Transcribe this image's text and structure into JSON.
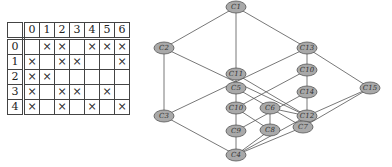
{
  "context_table": {
    "columns": [
      "0",
      "1",
      "2",
      "3",
      "4",
      "5",
      "6"
    ],
    "rows": [
      {
        "label": "0",
        "cells": [
          "",
          "×",
          "×",
          "",
          "×",
          "×",
          "×"
        ]
      },
      {
        "label": "1",
        "cells": [
          "×",
          "",
          "×",
          "×",
          "",
          "",
          "×"
        ]
      },
      {
        "label": "2",
        "cells": [
          "×",
          "×",
          "",
          "",
          "",
          "",
          ""
        ]
      },
      {
        "label": "3",
        "cells": [
          "×",
          "",
          "×",
          "×",
          "",
          "×",
          ""
        ]
      },
      {
        "label": "4",
        "cells": [
          "×",
          "",
          "×",
          "",
          "×",
          "",
          "×"
        ]
      }
    ]
  },
  "lattice": {
    "nodes": [
      {
        "id": "c1",
        "label": "C1",
        "x": 236,
        "y": 7
      },
      {
        "id": "c2",
        "label": "C2",
        "x": 164,
        "y": 48
      },
      {
        "id": "c13",
        "label": "C13",
        "x": 307,
        "y": 48
      },
      {
        "id": "c11",
        "label": "C11",
        "x": 236,
        "y": 74
      },
      {
        "id": "c5",
        "label": "C5",
        "x": 236,
        "y": 88
      },
      {
        "id": "c10r",
        "label": "C10",
        "x": 307,
        "y": 70
      },
      {
        "id": "c15",
        "label": "C15",
        "x": 370,
        "y": 88
      },
      {
        "id": "c14",
        "label": "C14",
        "x": 307,
        "y": 92
      },
      {
        "id": "c3",
        "label": "C3",
        "x": 164,
        "y": 116
      },
      {
        "id": "c10",
        "label": "C10",
        "x": 236,
        "y": 108
      },
      {
        "id": "c6",
        "label": "C6",
        "x": 270,
        "y": 108
      },
      {
        "id": "c12",
        "label": "C12",
        "x": 307,
        "y": 116
      },
      {
        "id": "c9",
        "label": "C9",
        "x": 236,
        "y": 131
      },
      {
        "id": "c8",
        "label": "C8",
        "x": 270,
        "y": 130
      },
      {
        "id": "c7",
        "label": "C7",
        "x": 303,
        "y": 127
      },
      {
        "id": "c4",
        "label": "C4",
        "x": 236,
        "y": 155
      }
    ],
    "edges": [
      [
        "c1",
        "c2"
      ],
      [
        "c1",
        "c11"
      ],
      [
        "c1",
        "c13"
      ],
      [
        "c2",
        "c3"
      ],
      [
        "c2",
        "c12"
      ],
      [
        "c13",
        "c3"
      ],
      [
        "c13",
        "c10r"
      ],
      [
        "c13",
        "c15"
      ],
      [
        "c11",
        "c5"
      ],
      [
        "c11",
        "c12"
      ],
      [
        "c5",
        "c10"
      ],
      [
        "c5",
        "c7"
      ],
      [
        "c10r",
        "c14"
      ],
      [
        "c10r",
        "c10"
      ],
      [
        "c14",
        "c12"
      ],
      [
        "c14",
        "c9"
      ],
      [
        "c15",
        "c12"
      ],
      [
        "c15",
        "c7"
      ],
      [
        "c3",
        "c4"
      ],
      [
        "c10",
        "c9"
      ],
      [
        "c10",
        "c8"
      ],
      [
        "c6",
        "c8"
      ],
      [
        "c6",
        "c12"
      ],
      [
        "c9",
        "c4"
      ],
      [
        "c8",
        "c4"
      ],
      [
        "c7",
        "c4"
      ],
      [
        "c12",
        "c4"
      ]
    ]
  }
}
